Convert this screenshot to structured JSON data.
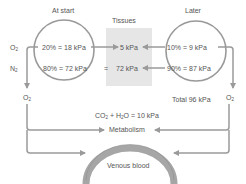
{
  "headings": {
    "at_start": "At start",
    "tissues": "Tissues",
    "later": "Later"
  },
  "gas_labels": {
    "o2": "O",
    "n2": "N",
    "sub2": "2"
  },
  "at_start": {
    "o2": "20% = 18 kPa",
    "n2": "80% = 72 kPa"
  },
  "tissues": {
    "o2": "5 kPa",
    "equals": "=",
    "n2": "72 kPa"
  },
  "later": {
    "o2": "10% = 9 kPa",
    "n2": "90% = 87 kPa",
    "total": "Total 96 kPa"
  },
  "bottom": {
    "left_o2": "O",
    "right_o2": "O",
    "co2_h2o_a": "CO",
    "co2_h2o_b": " + H",
    "co2_h2o_c": "O = 10 kPa",
    "metabolism": "Metabolism",
    "venous_blood": "Venous blood"
  },
  "colors": {
    "line": "#9a9a9a",
    "tissue_box": "#e6e6e6",
    "arc": "#a6a6a6",
    "text": "#555555"
  }
}
